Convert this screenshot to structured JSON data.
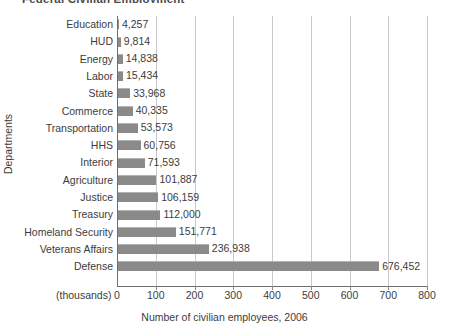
{
  "title_clipped": "Federal Civilian Employment",
  "axis": {
    "y_label": "Departments",
    "x_label": "Number of civilian employees, 2006",
    "units_note": "(thousands)",
    "x_ticks": [
      "0",
      "100",
      "200",
      "300",
      "400",
      "500",
      "600",
      "700",
      "800"
    ]
  },
  "colors": {
    "bar_fill": "#8a8a8a",
    "bar_top_edge": "#b4b4b4",
    "gridline": "#c9c9c9",
    "axis": "#6e6e6e",
    "text": "#3c3c3c",
    "background": "#ffffff"
  },
  "chart_data": {
    "type": "bar",
    "orientation": "horizontal",
    "title": "Federal Civilian Employment",
    "xlabel": "Number of civilian employees, 2006",
    "ylabel": "Departments",
    "xlim": [
      0,
      800
    ],
    "x_units": "thousands",
    "grid": "vertical",
    "legend": "none",
    "categories": [
      "Education",
      "HUD",
      "Energy",
      "Labor",
      "State",
      "Commerce",
      "Transportation",
      "HHS",
      "Interior",
      "Agriculture",
      "Justice",
      "Treasury",
      "Homeland Security",
      "Veterans Affairs",
      "Defense"
    ],
    "values": [
      4257,
      9814,
      14838,
      15434,
      33968,
      40335,
      53573,
      60756,
      71593,
      101887,
      106159,
      112000,
      151771,
      236938,
      676452
    ],
    "value_labels": [
      "4,257",
      "9,814",
      "14,838",
      "15,434",
      "33,968",
      "40,335",
      "53,573",
      "60,756",
      "71,593",
      "101,887",
      "106,159",
      "112,000",
      "151,771",
      "236,938",
      "676,452"
    ]
  }
}
